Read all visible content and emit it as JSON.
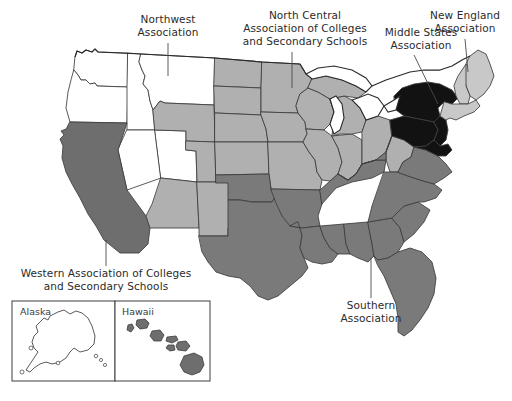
{
  "figure": {
    "background_color": "#ffffff",
    "width": 512,
    "height": 401
  },
  "palette": {
    "northwest": "#ffffff",
    "north_central": "#b0b0b0",
    "southern": "#7a7a7a",
    "middle_states": "#121212",
    "new_england": "#c8c8c8",
    "western": "#6e6e6e",
    "outline": "#2a2a2a",
    "state_border": "#3c3c3c",
    "text": "#2b2b2b",
    "lake_fill": "#ffffff"
  },
  "labels": {
    "northwest": {
      "lines": [
        "Northwest",
        "Association"
      ],
      "line1": "Northwest",
      "line2": "Association"
    },
    "north_central": {
      "lines": [
        "North Central",
        "Association of Colleges",
        "and Secondary Schools"
      ],
      "line1": "North Central",
      "line2": "Association of Colleges",
      "line3": "and Secondary Schools"
    },
    "new_england": {
      "lines": [
        "New England",
        "Association"
      ],
      "line1": "New England",
      "line2": "Association"
    },
    "middle_states": {
      "lines": [
        "Middle States",
        "Association"
      ],
      "line1": "Middle States",
      "line2": "Association"
    },
    "southern": {
      "lines": [
        "Southern",
        "Association"
      ],
      "line1": "Southern",
      "line2": "Association"
    },
    "western": {
      "lines": [
        "Western Association of Colleges",
        "and Secondary Schools"
      ],
      "line1": "Western Association of Colleges",
      "line2": "and Secondary Schools"
    }
  },
  "insets": {
    "alaska": {
      "label": "Alaska",
      "region": "northwest",
      "fill": "#ffffff"
    },
    "hawaii": {
      "label": "Hawaii",
      "region": "western",
      "fill": "#6e6e6e"
    }
  },
  "regions": [
    {
      "name": "Northwest Association",
      "fill": "#ffffff",
      "states": [
        "Washington",
        "Oregon",
        "Idaho",
        "Montana",
        "Nevada",
        "Utah",
        "Alaska"
      ]
    },
    {
      "name": "North Central Association of Colleges and Secondary Schools",
      "fill": "#b0b0b0",
      "states": [
        "North Dakota",
        "South Dakota",
        "Nebraska",
        "Kansas",
        "Minnesota",
        "Iowa",
        "Missouri",
        "Wisconsin",
        "Illinois",
        "Indiana",
        "Michigan",
        "Ohio",
        "Wyoming",
        "Colorado",
        "Arizona",
        "New Mexico",
        "West Virginia"
      ]
    },
    {
      "name": "Southern Association",
      "fill": "#7a7a7a",
      "states": [
        "Texas",
        "Oklahoma",
        "Arkansas",
        "Louisiana",
        "Mississippi",
        "Alabama",
        "Tennessee",
        "Kentucky",
        "Georgia",
        "Florida",
        "South Carolina",
        "North Carolina",
        "Virginia"
      ]
    },
    {
      "name": "Middle States Association",
      "fill": "#121212",
      "states": [
        "New York",
        "Pennsylvania",
        "New Jersey",
        "Delaware",
        "Maryland"
      ]
    },
    {
      "name": "New England Association",
      "fill": "#c8c8c8",
      "states": [
        "Maine",
        "New Hampshire",
        "Vermont",
        "Massachusetts",
        "Rhode Island",
        "Connecticut"
      ]
    },
    {
      "name": "Western Association of Colleges and Secondary Schools",
      "fill": "#6e6e6e",
      "states": [
        "California",
        "Hawaii"
      ]
    }
  ]
}
